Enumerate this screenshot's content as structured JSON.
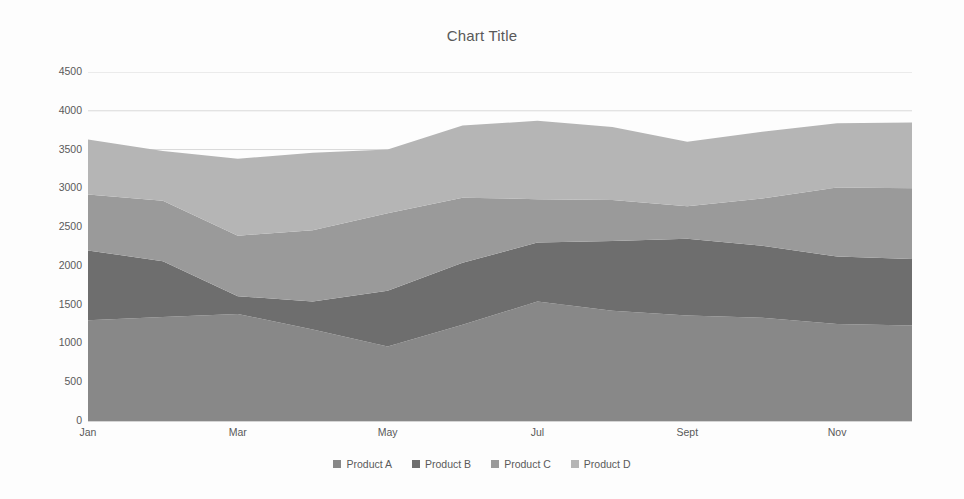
{
  "chart_data": {
    "type": "area",
    "stacked": true,
    "title": "Chart Title",
    "xlabel": "",
    "ylabel": "",
    "ylim": [
      0,
      4500
    ],
    "ytick_step": 500,
    "yticks": [
      0,
      500,
      1000,
      1500,
      2000,
      2500,
      3000,
      3500,
      4000,
      4500
    ],
    "ytick_labels": [
      "0",
      "500",
      "1000",
      "1500",
      "2000",
      "2500",
      "3000",
      "3500",
      "4000",
      "4500"
    ],
    "grid": true,
    "grid_axis": "y",
    "legend_position": "bottom",
    "categories": [
      "Jan",
      "Feb",
      "Mar",
      "Apr",
      "May",
      "Jun",
      "Jul",
      "Aug",
      "Sept",
      "Oct",
      "Nov",
      "Dec"
    ],
    "xtick_labels": [
      "Jan",
      "",
      "Mar",
      "",
      "May",
      "",
      "Jul",
      "",
      "Sept",
      "",
      "Nov",
      ""
    ],
    "xtick_labels_shown": [
      "Jan",
      "Mar",
      "May",
      "Jul",
      "Sept",
      "Nov"
    ],
    "series": [
      {
        "name": "Product A",
        "color": "#888888",
        "values": [
          1300,
          1340,
          1380,
          1180,
          960,
          1240,
          1540,
          1420,
          1360,
          1330,
          1250,
          1230
        ]
      },
      {
        "name": "Product B",
        "color": "#6e6e6e",
        "values": [
          900,
          720,
          230,
          360,
          720,
          800,
          760,
          900,
          990,
          930,
          870,
          860
        ]
      },
      {
        "name": "Product C",
        "color": "#9a9a9a",
        "values": [
          720,
          780,
          780,
          920,
          1000,
          840,
          560,
          530,
          420,
          610,
          890,
          910
        ]
      },
      {
        "name": "Product D",
        "color": "#b5b5b5",
        "values": [
          710,
          640,
          990,
          1000,
          820,
          930,
          1010,
          940,
          830,
          860,
          830,
          850
        ]
      }
    ],
    "totals": [
      3630,
      3480,
      3380,
      3460,
      3500,
      3810,
      3870,
      3790,
      3600,
      3730,
      3840,
      3850
    ]
  },
  "legend": {
    "items": [
      {
        "label": "Product A",
        "color": "#888888"
      },
      {
        "label": "Product B",
        "color": "#6e6e6e"
      },
      {
        "label": "Product C",
        "color": "#9a9a9a"
      },
      {
        "label": "Product D",
        "color": "#b5b5b5"
      }
    ]
  },
  "style": {
    "background": "#fdfdfd",
    "grid_color": "#d9d9d9",
    "axis_color": "#d4d4d4",
    "text_color": "#5a5a5a"
  }
}
